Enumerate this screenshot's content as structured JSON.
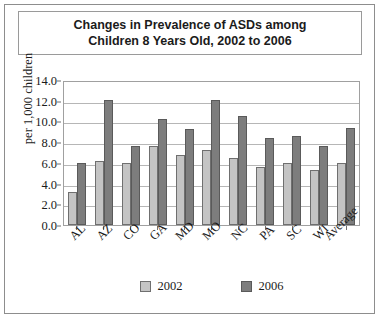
{
  "figure": {
    "title_lines": [
      "Changes in Prevalence of ASDs among",
      "Children 8 Years Old, 2002 to 2006"
    ]
  },
  "colors": {
    "series_2002": "#c4c4c4",
    "series_2006": "#7d7d7d",
    "frame": "#8d8d8d",
    "gridline": "#b6b6b6",
    "text": "#1b1b1b"
  },
  "chart_data": {
    "type": "bar",
    "title": "Changes in Prevalence of ASDs among Children 8 Years Old, 2002 to 2006",
    "xlabel": "",
    "ylabel": "per 1,000 children",
    "ylim": [
      0.0,
      14.0
    ],
    "ytick_step": 2.0,
    "yticks": [
      "14.0",
      "12.0",
      "10.0",
      "8.0",
      "6.0",
      "4.0",
      "2.0",
      "0.0"
    ],
    "ytick_values": [
      14.0,
      12.0,
      10.0,
      8.0,
      6.0,
      4.0,
      2.0,
      0.0
    ],
    "grid": true,
    "legend_position": "bottom",
    "categories": [
      "AL",
      "AZ",
      "CO",
      "GA",
      "MD",
      "MO",
      "NC",
      "PA",
      "SC",
      "WI",
      "Average"
    ],
    "series": [
      {
        "name": "2002",
        "color": "#c4c4c4",
        "values": [
          3.2,
          6.2,
          6.0,
          7.6,
          6.8,
          7.2,
          6.5,
          5.6,
          6.0,
          5.3,
          6.0
        ]
      },
      {
        "name": "2006",
        "color": "#7d7d7d",
        "values": [
          6.0,
          12.1,
          7.6,
          10.2,
          9.3,
          12.1,
          10.5,
          8.4,
          8.6,
          7.6,
          9.4
        ]
      }
    ]
  }
}
